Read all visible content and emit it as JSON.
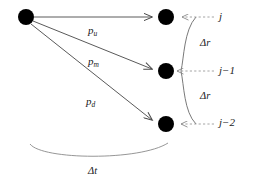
{
  "figure": {
    "background_color": "#ffffff",
    "line_color": "#4a4a4a",
    "node_color": "#000000",
    "text_color": "#1a1a1a"
  },
  "nodes": [
    {
      "id": "origin",
      "label": "origin-node",
      "cx": 26,
      "cy": 17,
      "r": 8
    },
    {
      "id": "up",
      "label": "up-node",
      "cx": 166,
      "cy": 17,
      "r": 8
    },
    {
      "id": "middle",
      "label": "middle-node",
      "cx": 166,
      "cy": 71,
      "r": 8
    },
    {
      "id": "down",
      "label": "down-node",
      "cx": 166,
      "cy": 124,
      "r": 8
    }
  ],
  "branches": [
    {
      "id": "up",
      "probability_label": "p",
      "subscript": "u",
      "label_x": 88,
      "label_y": 25,
      "from": "origin",
      "to": "up"
    },
    {
      "id": "middle",
      "probability_label": "p",
      "subscript": "m",
      "label_x": 88,
      "label_y": 56,
      "from": "origin",
      "to": "middle"
    },
    {
      "id": "down",
      "probability_label": "p",
      "subscript": "d",
      "label_x": 86,
      "label_y": 96,
      "from": "origin",
      "to": "down"
    }
  ],
  "level_labels": [
    {
      "id": "j",
      "text": "j",
      "x": 219,
      "y": 11
    },
    {
      "id": "j-1",
      "text": "j−1",
      "x": 219,
      "y": 65
    },
    {
      "id": "j-2",
      "text": "j−2",
      "x": 219,
      "y": 117
    }
  ],
  "spacing_labels": [
    {
      "id": "delta-r-upper",
      "text": "Δr",
      "x": 200,
      "y": 38
    },
    {
      "id": "delta-r-lower",
      "text": "Δr",
      "x": 200,
      "y": 91
    }
  ],
  "time_step": {
    "id": "delta-t",
    "text": "Δt",
    "x": 88,
    "y": 166,
    "brace_left_x": 30,
    "brace_right_x": 168,
    "brace_y": 144
  }
}
